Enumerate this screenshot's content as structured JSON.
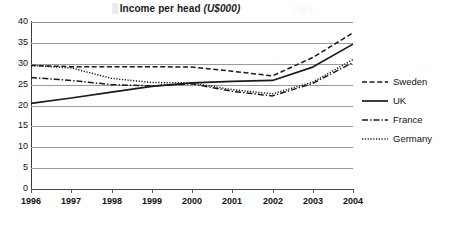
{
  "chart_data": {
    "type": "line",
    "title": "Income per head (U$000)",
    "title_main": "Income per head ",
    "title_units": "(U$000)",
    "xlabel": "",
    "ylabel": "",
    "x": [
      "1996",
      "1997",
      "1998",
      "1999",
      "2000",
      "2001",
      "2002",
      "2003",
      "2004"
    ],
    "categories": [
      "1996",
      "1997",
      "1998",
      "1999",
      "2000",
      "2001",
      "2002",
      "2003",
      "2004"
    ],
    "ylim": [
      0,
      40
    ],
    "ytick_labels": [
      "40",
      "35",
      "30",
      "25",
      "20",
      "15",
      "10",
      "5",
      "0"
    ],
    "yticks": [
      40,
      35,
      30,
      25,
      20,
      15,
      10,
      5,
      0
    ],
    "grid": true,
    "legend_position": "right",
    "series": [
      {
        "name": "Sweden",
        "style": "dashed",
        "color": "#1a1a1a",
        "values": [
          29.6,
          29.3,
          29.3,
          29.3,
          29.2,
          28.2,
          27.1,
          31.5,
          37.4
        ]
      },
      {
        "name": "UK",
        "style": "solid",
        "color": "#1a1a1a",
        "values": [
          20.5,
          21.8,
          23.2,
          24.6,
          25.4,
          25.8,
          26.0,
          29.2,
          34.7
        ]
      },
      {
        "name": "France",
        "style": "dash-dot",
        "color": "#1a1a1a",
        "values": [
          26.7,
          26.0,
          25.0,
          24.7,
          25.2,
          23.4,
          22.3,
          25.3,
          30.3
        ]
      },
      {
        "name": "Germany",
        "style": "dotted",
        "color": "#1a1a1a",
        "values": [
          29.6,
          29.0,
          26.5,
          25.5,
          25.4,
          23.8,
          22.8,
          25.6,
          31.0
        ]
      }
    ]
  },
  "legend": {
    "items": [
      {
        "label": "Sweden"
      },
      {
        "label": "UK"
      },
      {
        "label": "France"
      },
      {
        "label": "Germany"
      }
    ]
  },
  "artifacts": {
    "smudge_left": "█░▒",
    "smudge_right": "░▒░",
    "smudge_mid": "░"
  }
}
